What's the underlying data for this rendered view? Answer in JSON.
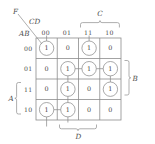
{
  "diagram": {
    "type": "karnaugh-map",
    "function_label": "F",
    "column_group_label": "CD",
    "row_group_label": "AB",
    "column_headers": [
      "00",
      "01",
      "11",
      "10"
    ],
    "row_headers": [
      "00",
      "01",
      "11",
      "10"
    ],
    "cells": [
      [
        "1",
        "0",
        "1",
        "0"
      ],
      [
        "0",
        "1",
        "1",
        "1"
      ],
      [
        "0",
        "1",
        "0",
        "1"
      ],
      [
        "1",
        "1",
        "0",
        "0"
      ]
    ],
    "brackets": {
      "top": {
        "label": "C",
        "spans": [
          "11",
          "10"
        ]
      },
      "right": {
        "label": "B",
        "spans": [
          "01",
          "11"
        ]
      },
      "bottom": {
        "label": "D",
        "spans": [
          "01",
          "11"
        ]
      },
      "left": {
        "label": "A",
        "spans": [
          "11",
          "10"
        ]
      }
    },
    "colors": {
      "grid_line": "#8c8c8c",
      "group_line": "#8c8c8c",
      "text": "#3f3f3f",
      "background": "#ffffff"
    }
  }
}
